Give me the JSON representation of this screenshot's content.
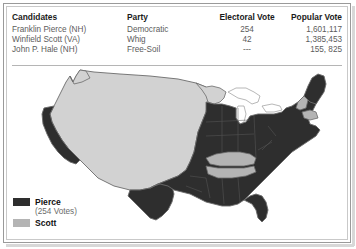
{
  "table": {
    "headers": {
      "candidates": "Candidates",
      "party": "Party",
      "electoral_vote": "Electoral Vote",
      "popular_vote": "Popular Vote"
    },
    "rows": [
      {
        "candidate": "Franklin Pierce (NH)",
        "party": "Democratic",
        "electoral_vote": "254",
        "popular_vote": "1,601,117"
      },
      {
        "candidate": "Winfield Scott (VA)",
        "party": "Whig",
        "electoral_vote": "42",
        "popular_vote": "1,385,453"
      },
      {
        "candidate": "John P. Hale (NH)",
        "party": "Free-Soil",
        "electoral_vote": "---",
        "popular_vote": "155, 825"
      }
    ]
  },
  "legend": {
    "items": [
      {
        "label": "Pierce",
        "sub": "(254 Votes)",
        "color": "#2e2e2e"
      },
      {
        "label": "Scott",
        "sub": "",
        "color": "#b4b4b4"
      }
    ]
  },
  "map": {
    "colors": {
      "pierce": "#2e2e2e",
      "scott": "#b4b4b4",
      "territory": "#d2d2d2",
      "outline": "#6b6b6b",
      "state_line": "#555555"
    }
  }
}
